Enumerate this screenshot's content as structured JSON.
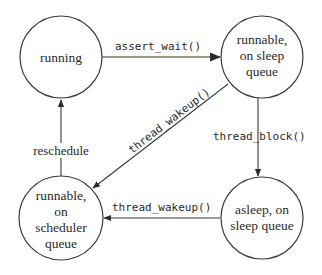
{
  "diagram": {
    "type": "state-transition",
    "states": [
      {
        "id": "running",
        "lines": [
          "running"
        ]
      },
      {
        "id": "runnable-sleep-queue",
        "lines": [
          "runnable,",
          "on sleep",
          "queue"
        ]
      },
      {
        "id": "runnable-scheduler-queue",
        "lines": [
          "runnable,",
          "on",
          "scheduler",
          "queue"
        ]
      },
      {
        "id": "asleep-sleep-queue",
        "lines": [
          "asleep, on",
          "sleep queue"
        ]
      }
    ],
    "transitions": [
      {
        "from": "running",
        "to": "runnable-sleep-queue",
        "label": "assert_wait()"
      },
      {
        "from": "runnable-sleep-queue",
        "to": "asleep-sleep-queue",
        "label": "thread_block()"
      },
      {
        "from": "runnable-sleep-queue",
        "to": "runnable-scheduler-queue",
        "label": "thread_wakeup()"
      },
      {
        "from": "asleep-sleep-queue",
        "to": "runnable-scheduler-queue",
        "label": "thread_wakeup()"
      },
      {
        "from": "runnable-scheduler-queue",
        "to": "running",
        "label": "reschedule"
      }
    ],
    "colors": {
      "stroke": "#3a3a3a",
      "assert_wait_edge": "#7a7650",
      "text": "#2a2a2a",
      "background": "#ffffff"
    }
  }
}
